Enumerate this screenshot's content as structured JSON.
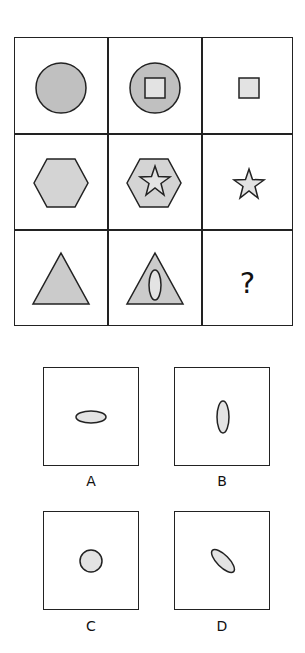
{
  "puzzle": {
    "type": "3x3 matrix reasoning",
    "colors": {
      "stroke": "#222222",
      "outer_circle_fill": "#c0c0c0",
      "outer_hexagon_fill": "#d4d4d4",
      "outer_triangle_fill": "#cbcbcb",
      "inner_fill": "#e3e3e3"
    },
    "grid": [
      [
        {
          "shape": "circle",
          "inner": null
        },
        {
          "shape": "circle",
          "inner": "square"
        },
        {
          "shape": null,
          "inner": "square"
        }
      ],
      [
        {
          "shape": "hexagon",
          "inner": null
        },
        {
          "shape": "hexagon",
          "inner": "star"
        },
        {
          "shape": null,
          "inner": "star"
        }
      ],
      [
        {
          "shape": "triangle",
          "inner": null
        },
        {
          "shape": "triangle",
          "inner": "vertical-ellipse"
        },
        {
          "shape": "unknown",
          "inner": null,
          "label": "?"
        }
      ]
    ],
    "missing_label": "?",
    "options": [
      {
        "label": "A",
        "shape": "horizontal-ellipse"
      },
      {
        "label": "B",
        "shape": "vertical-ellipse"
      },
      {
        "label": "C",
        "shape": "circle"
      },
      {
        "label": "D",
        "shape": "diagonal-ellipse"
      }
    ]
  }
}
